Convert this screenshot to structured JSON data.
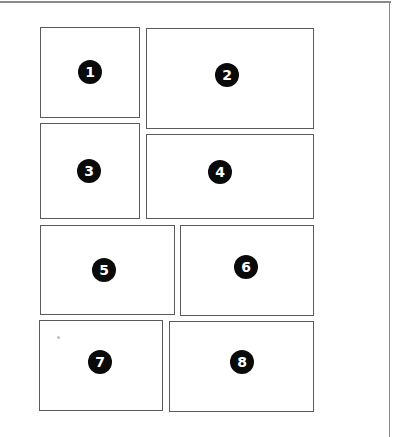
{
  "diagram": {
    "title": "",
    "frame": {
      "line_color": "#8a8a8a"
    },
    "panel_border_color": "#5a5a5a",
    "badge_color": "#0a0a0a",
    "badge_text_color": "#ffffff",
    "panels": [
      {
        "id": 1,
        "label": "1",
        "x": 40,
        "y": 27,
        "w": 100,
        "h": 91,
        "cx": 90,
        "cy": 72
      },
      {
        "id": 2,
        "label": "2",
        "x": 146,
        "y": 28,
        "w": 168,
        "h": 101,
        "cx": 227,
        "cy": 75
      },
      {
        "id": 3,
        "label": "3",
        "x": 40,
        "y": 123,
        "w": 100,
        "h": 96,
        "cx": 89,
        "cy": 171
      },
      {
        "id": 4,
        "label": "4",
        "x": 146,
        "y": 134,
        "w": 168,
        "h": 85,
        "cx": 220,
        "cy": 172
      },
      {
        "id": 5,
        "label": "5",
        "x": 40,
        "y": 225,
        "w": 135,
        "h": 90,
        "cx": 104,
        "cy": 270
      },
      {
        "id": 6,
        "label": "6",
        "x": 180,
        "y": 225,
        "w": 134,
        "h": 91,
        "cx": 246,
        "cy": 267
      },
      {
        "id": 7,
        "label": "7",
        "x": 39,
        "y": 320,
        "w": 124,
        "h": 91,
        "cx": 100,
        "cy": 362
      },
      {
        "id": 8,
        "label": "8",
        "x": 169,
        "y": 321,
        "w": 145,
        "h": 91,
        "cx": 242,
        "cy": 362
      }
    ],
    "speck": {
      "x": 57,
      "y": 336
    }
  }
}
